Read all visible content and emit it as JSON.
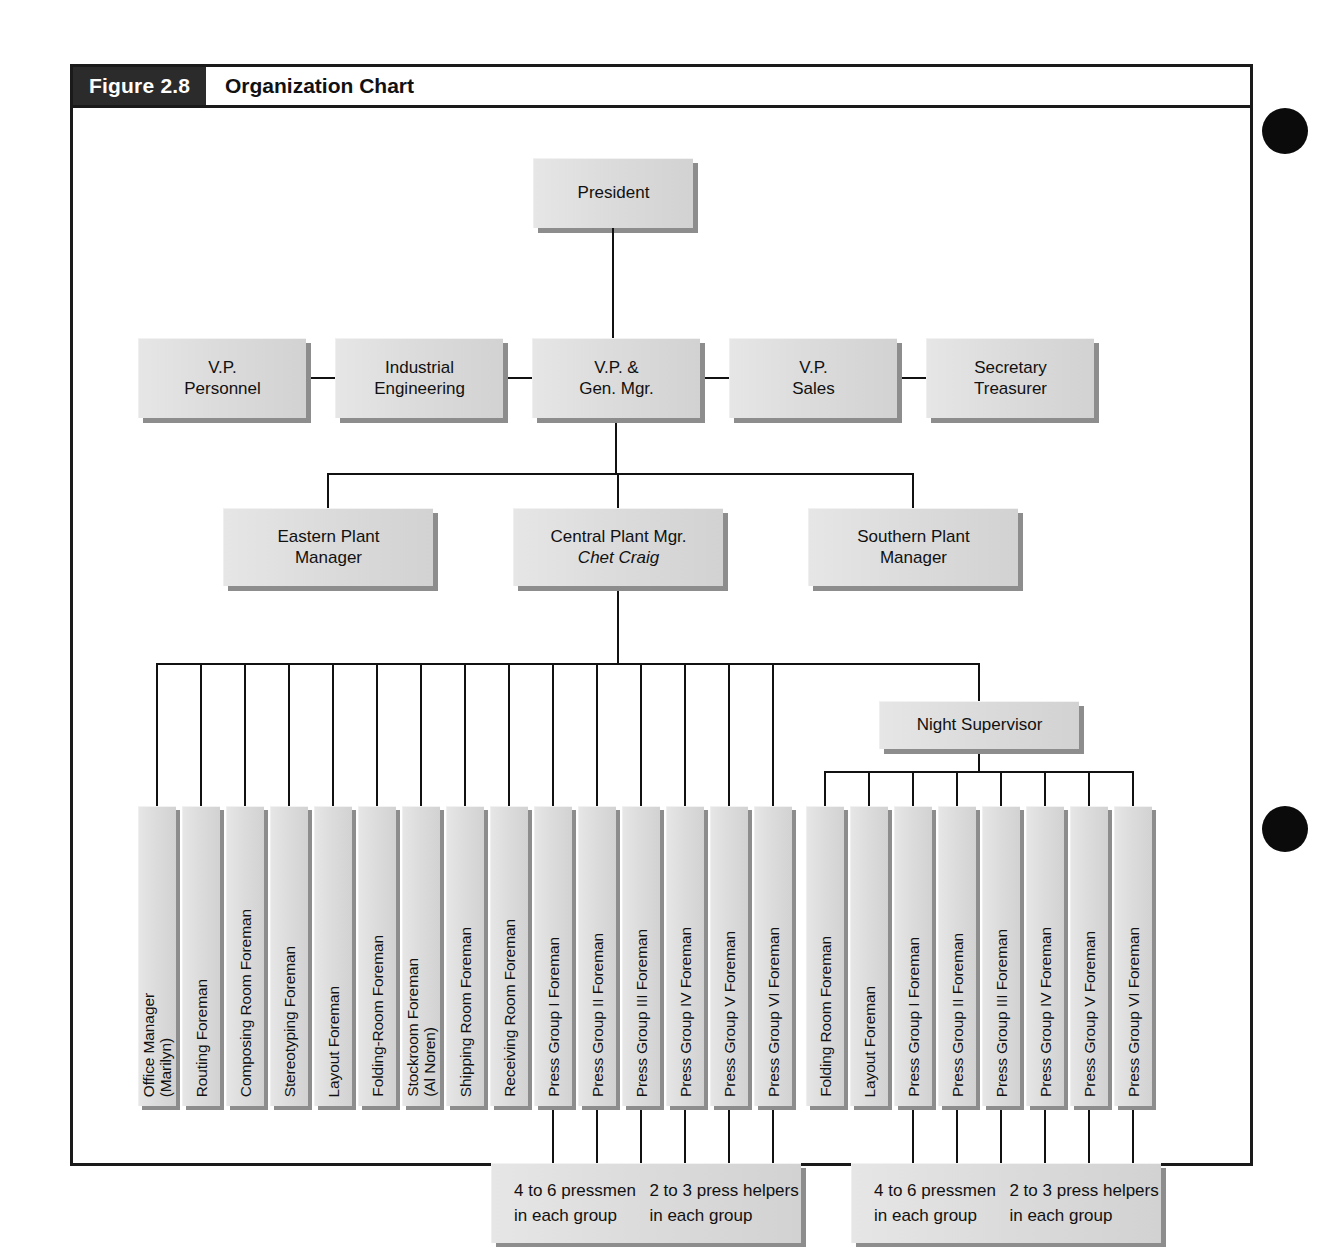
{
  "figure": {
    "number_label": "Figure 2.8",
    "title": "Organization Chart"
  },
  "chart_data": {
    "type": "diagram",
    "title": "Organization Chart",
    "levels": [
      {
        "name": "executive",
        "nodes": [
          "President"
        ]
      },
      {
        "name": "vp_row",
        "nodes": [
          "V.P.\nPersonnel",
          "Industrial\nEngineering",
          "V.P. &\nGen. Mgr.",
          "V.P.\nSales",
          "Secretary\nTreasurer"
        ]
      },
      {
        "name": "plant_row",
        "nodes": [
          "Eastern Plant\nManager",
          "Central Plant Mgr.\nChet Craig",
          "Southern Plant\nManager"
        ]
      },
      {
        "name": "night_row",
        "nodes": [
          "Night Supervisor"
        ]
      }
    ]
  },
  "nodes": {
    "president": {
      "label": "President"
    },
    "vp_personnel": {
      "line1": "V.P.",
      "line2": "Personnel"
    },
    "industrial_engineering": {
      "line1": "Industrial",
      "line2": "Engineering"
    },
    "vp_gen_mgr": {
      "line1": "V.P. &",
      "line2": "Gen. Mgr."
    },
    "vp_sales": {
      "line1": "V.P.",
      "line2": "Sales"
    },
    "secretary_treasurer": {
      "line1": "Secretary",
      "line2": "Treasurer"
    },
    "eastern_plant_manager": {
      "line1": "Eastern Plant",
      "line2": "Manager"
    },
    "central_plant_manager": {
      "line1": "Central Plant Mgr.",
      "line2": "Chet Craig"
    },
    "southern_plant_manager": {
      "line1": "Southern Plant",
      "line2": "Manager"
    },
    "night_supervisor": {
      "label": "Night Supervisor"
    }
  },
  "day_shift_foremen": [
    {
      "id": "office-manager",
      "label": "Office Manager\n(Marilyn)"
    },
    {
      "id": "routing-foreman",
      "label": "Routing Foreman"
    },
    {
      "id": "composing-room-foreman",
      "label": "Composing Room Foreman"
    },
    {
      "id": "stereotyping-foreman",
      "label": "Stereotyping Foreman"
    },
    {
      "id": "layout-foreman",
      "label": "Layout Foreman"
    },
    {
      "id": "folding-room-foreman",
      "label": "Folding-Room Foreman"
    },
    {
      "id": "stockroom-foreman",
      "label": "Stockroom Foreman\n(Al Noren)"
    },
    {
      "id": "shipping-room-foreman",
      "label": "Shipping Room Foreman"
    },
    {
      "id": "receiving-room-foreman",
      "label": "Receiving Room Foreman"
    },
    {
      "id": "press-group-1-foreman",
      "label": "Press Group I Foreman"
    },
    {
      "id": "press-group-2-foreman",
      "label": "Press Group II Foreman"
    },
    {
      "id": "press-group-3-foreman",
      "label": "Press Group III Foreman"
    },
    {
      "id": "press-group-4-foreman",
      "label": "Press Group IV Foreman"
    },
    {
      "id": "press-group-5-foreman",
      "label": "Press Group V Foreman"
    },
    {
      "id": "press-group-6-foreman",
      "label": "Press Group VI Foreman"
    }
  ],
  "night_shift_foremen": [
    {
      "id": "night-folding-room-foreman",
      "label": "Folding Room Foreman"
    },
    {
      "id": "night-layout-foreman",
      "label": "Layout Foreman"
    },
    {
      "id": "night-press-group-1-foreman",
      "label": "Press Group I Foreman"
    },
    {
      "id": "night-press-group-2-foreman",
      "label": "Press Group II Foreman"
    },
    {
      "id": "night-press-group-3-foreman",
      "label": "Press Group III Foreman"
    },
    {
      "id": "night-press-group-4-foreman",
      "label": "Press Group IV Foreman"
    },
    {
      "id": "night-press-group-5-foreman",
      "label": "Press Group V Foreman"
    },
    {
      "id": "night-press-group-6-foreman",
      "label": "Press Group VI Foreman"
    }
  ],
  "notes": {
    "day": {
      "line1": "4 to 6 pressmen in each group",
      "line2": "2 to 3 press helpers in each group"
    },
    "night": {
      "line1": "4 to 6 pressmen in each group",
      "line2": "2 to 3 press helpers in each group"
    }
  },
  "colors": {
    "box_fill": "#dcdcdc",
    "box_shadow": "#8d8d8d",
    "line": "#111111",
    "header_block": "#2b2b2b",
    "frame": "#1a1a1a"
  }
}
